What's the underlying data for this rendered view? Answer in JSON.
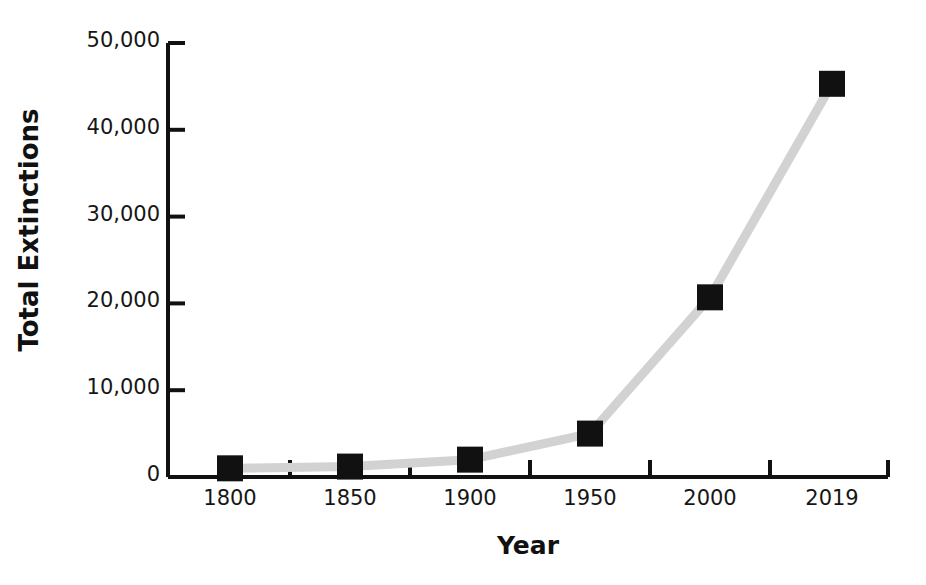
{
  "chart_data": {
    "type": "line",
    "title": "NUMBER OF EXTINCTIONS AND WARNING",
    "xlabel": "Year",
    "ylabel": "Total Extinctions",
    "categories": [
      "1800",
      "1850",
      "1900",
      "1950",
      "2000",
      "2019"
    ],
    "x": [
      1800,
      1850,
      1900,
      1950,
      2000,
      2019
    ],
    "values": [
      1000,
      1200,
      2000,
      5000,
      20700,
      45300
    ],
    "series": [
      {
        "name": "Total Extinctions",
        "values": [
          1000,
          1200,
          2000,
          5000,
          20700,
          45300
        ]
      }
    ],
    "ylim": [
      0,
      50000
    ],
    "yticks": [
      0,
      10000,
      20000,
      30000,
      40000,
      50000
    ],
    "ytick_labels": [
      "0",
      "10,000",
      "20,000",
      "30,000",
      "40,000",
      "50,000"
    ],
    "xtick_labels": [
      "1800",
      "1850",
      "1900",
      "1950",
      "2000",
      "2019"
    ],
    "grid": false,
    "legend": false,
    "legend_position": "none",
    "line_color": "#d2d2d2",
    "marker_color": "#111111",
    "marker_shape": "square",
    "axis_color": "#111111",
    "background_color": "#ffffff"
  }
}
